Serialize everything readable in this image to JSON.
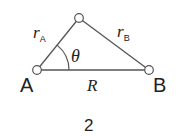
{
  "figure": {
    "number_label": "2",
    "points": {
      "A": {
        "label": "A",
        "x": 37,
        "y": 70
      },
      "B": {
        "label": "B",
        "x": 149,
        "y": 70
      },
      "C": {
        "label": "",
        "x": 79,
        "y": 18
      }
    },
    "edges": {
      "rA": {
        "label": "r",
        "subscript": "A"
      },
      "rB": {
        "label": "r",
        "subscript": "B"
      },
      "R": {
        "label": "R"
      }
    },
    "angle": {
      "label": "θ",
      "vertex": "A"
    },
    "colors": {
      "line": "#555555",
      "text": "#222222",
      "node_fill": "#ffffff"
    }
  }
}
